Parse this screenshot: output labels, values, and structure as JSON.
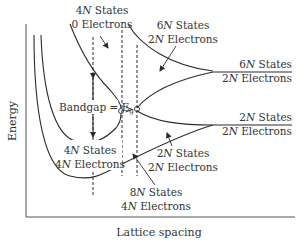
{
  "diagram": {
    "type": "band-formation-diagram",
    "axes": {
      "x_label": "Lattice spacing",
      "y_label": "Energy"
    },
    "labels": {
      "top_left": {
        "line1_num": "4",
        "line1_rest": " States",
        "line2": "0 Electrons"
      },
      "top_mid": {
        "line1_num": "6",
        "line1_rest": " States",
        "line2_num": "2",
        "line2_rest": " Electrons"
      },
      "right_upper": {
        "line1_num": "6",
        "line1_rest": " States",
        "line2_num": "2",
        "line2_rest": " Electrons"
      },
      "right_lower": {
        "line1_num": "2",
        "line1_rest": " States",
        "line2_num": "2",
        "line2_rest": " Electrons"
      },
      "mid_lower": {
        "line1_num": "2",
        "line1_rest": " States",
        "line2_num": "2",
        "line2_rest": " Electrons"
      },
      "left_lower": {
        "line1_num": "4",
        "line1_rest": " States",
        "line2_num": "4",
        "line2_rest": " Electrons"
      },
      "bottom": {
        "line1_num": "8",
        "line1_rest": " States",
        "line2_num": "4",
        "line2_rest": " Electrons"
      },
      "bandgap": {
        "text": "Bandgap = E",
        "subscript": "g"
      },
      "gt_symbol": ">"
    },
    "italic_N": "N",
    "colors": {
      "line": "#2b2b2b",
      "axis": "#555555",
      "text": "#333333",
      "background": "#ffffff"
    }
  }
}
